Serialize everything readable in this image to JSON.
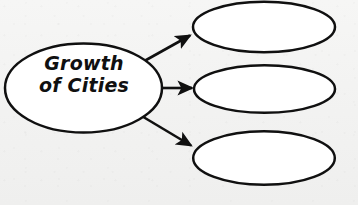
{
  "diagram": {
    "type": "concept-map",
    "orientation": "left-to-right",
    "background_color": "#f4f4f3",
    "stroke_color": "#101010",
    "fill_color": "#ffffff",
    "root": {
      "id": "root",
      "label_line1": "Growth",
      "label_line2": "of Cities",
      "label_full": "Growth of Cities",
      "shape": "ellipse",
      "cx": 83.5,
      "cy": 88,
      "rx": 79,
      "ry": 45
    },
    "branches": [
      {
        "id": "branch-1",
        "label": "",
        "position": "top",
        "shape": "ellipse",
        "cx": 264,
        "cy": 27,
        "rx": 71,
        "ry": 25.5
      },
      {
        "id": "branch-2",
        "label": "",
        "position": "middle",
        "shape": "ellipse",
        "cx": 264.5,
        "cy": 89,
        "rx": 70.5,
        "ry": 24
      },
      {
        "id": "branch-3",
        "label": "",
        "position": "bottom",
        "shape": "ellipse",
        "cx": 264,
        "cy": 158,
        "rx": 71,
        "ry": 27
      }
    ],
    "connectors": [
      {
        "id": "arrow-1",
        "from": "root",
        "to": "branch-1",
        "style": "solid-filled-arrowhead",
        "x1": 139,
        "y1": 64,
        "x2": 194,
        "y2": 33
      },
      {
        "id": "arrow-2",
        "from": "root",
        "to": "branch-2",
        "style": "solid-filled-arrowhead",
        "x1": 161,
        "y1": 88,
        "x2": 196,
        "y2": 88
      },
      {
        "id": "arrow-3",
        "from": "root",
        "to": "branch-3",
        "style": "solid-filled-arrowhead",
        "x1": 140,
        "y1": 115,
        "x2": 195,
        "y2": 148
      }
    ]
  }
}
